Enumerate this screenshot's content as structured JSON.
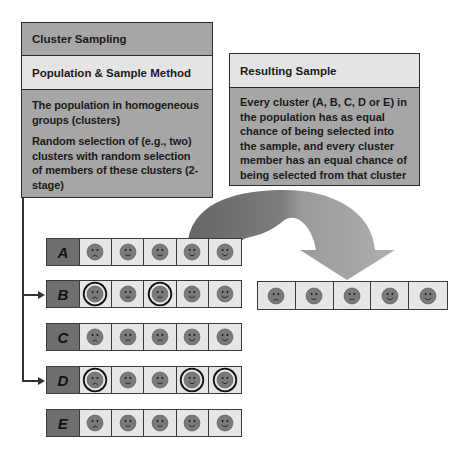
{
  "left_panel": {
    "title": "Cluster Sampling",
    "subtitle": "Population & Sample Method",
    "paragraphs": [
      "The population in homogeneous groups (clusters)",
      "Random selection of (e.g., two) clusters with random selection of members of these clusters (2-stage)"
    ]
  },
  "right_panel": {
    "title": "Resulting Sample",
    "body": "Every cluster (A, B, C, D or E) in the population has as equal chance of being selected into the sample, and every cluster member has an equal chance of being selected from that cluster"
  },
  "clusters": [
    {
      "label": "A",
      "selected": false,
      "members": [
        "sad",
        "neutral",
        "neutral",
        "happy",
        "happy"
      ],
      "circled": [
        false,
        false,
        false,
        false,
        false
      ]
    },
    {
      "label": "B",
      "selected": true,
      "members": [
        "sad",
        "neutral",
        "neutral",
        "happy",
        "happy"
      ],
      "circled": [
        true,
        false,
        true,
        false,
        false
      ]
    },
    {
      "label": "C",
      "selected": false,
      "members": [
        "sad",
        "neutral",
        "neutral",
        "happy",
        "happy"
      ],
      "circled": [
        false,
        false,
        false,
        false,
        false
      ]
    },
    {
      "label": "D",
      "selected": true,
      "members": [
        "sad",
        "neutral",
        "neutral",
        "happy",
        "happy"
      ],
      "circled": [
        true,
        false,
        false,
        true,
        true
      ]
    },
    {
      "label": "E",
      "selected": false,
      "members": [
        "sad",
        "neutral",
        "neutral",
        "happy",
        "happy"
      ],
      "circled": [
        false,
        false,
        false,
        false,
        false
      ]
    }
  ],
  "sample": {
    "members": [
      "sad",
      "neutral",
      "neutral",
      "happy",
      "happy"
    ]
  },
  "colors": {
    "dark_panel": "#a6a6a6",
    "light_panel": "#e4e4e4",
    "label_cell": "#6f6f6f",
    "face": "#7a7a7a",
    "arrow_dark": "#6b6b6b",
    "arrow_light": "#a8a8a8"
  }
}
